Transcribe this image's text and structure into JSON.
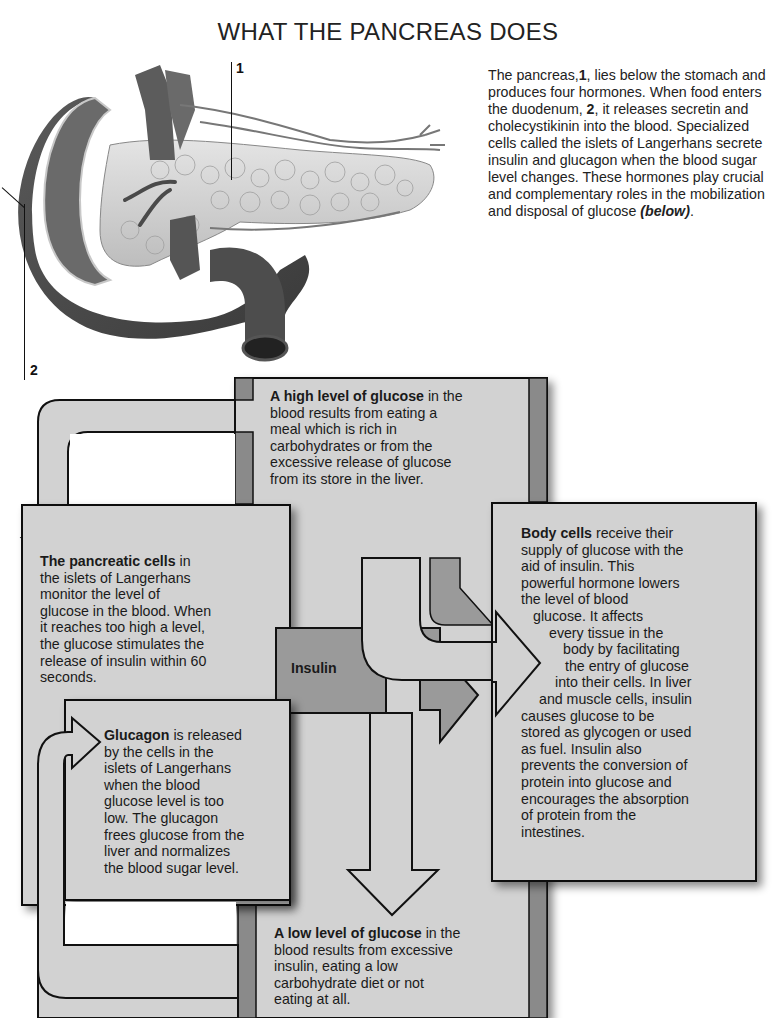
{
  "title": "WHAT THE PANCREAS DOES",
  "illustration": {
    "description": "Anatomical drawing of pancreas with duodenum and blood vessels",
    "labels": [
      {
        "number": "1",
        "target": "pancreas"
      },
      {
        "number": "2",
        "target": "duodenum"
      }
    ]
  },
  "intro": {
    "part1": "The pancreas,",
    "num1": "1",
    "part2": ", lies below the stomach and produces four hormones. When food enters the duodenum, ",
    "num2": "2",
    "part3": ", it releases secretin and cholecystikinin into the blood. Specialized cells called the islets of Langerhans secrete insulin and glucagon when the blood sugar level changes. These hormones play crucial and complementary roles in the mobilization and disposal of glucose ",
    "below": "(below)",
    "end": "."
  },
  "diagram": {
    "high_glucose": {
      "bold": "A high level of glucose",
      "lines": [
        " in the",
        "blood results from eating a",
        "meal which is rich in",
        "carbohydrates or from the",
        "excessive release of glucose",
        "from its store in the liver."
      ]
    },
    "pancreatic_cells": {
      "bold": "The pancreatic cells",
      "lines": [
        " in",
        "the islets of Langerhans",
        "monitor the level of",
        "glucose in the blood. When",
        "it reaches too high a level,",
        "the glucose stimulates the",
        "release of insulin within 60",
        "seconds."
      ]
    },
    "insulin_label": "Insulin",
    "body_cells": {
      "bold": "Body cells",
      "lines": [
        " receive their",
        "supply of glucose with the",
        "aid of insulin. This",
        "powerful hormone lowers",
        "the level of blood",
        "glucose. It affects",
        "every tissue in the",
        "body by facilitating",
        "the entry of glucose",
        "into their cells. In liver",
        "and muscle cells, insulin",
        "causes glucose to be",
        "stored as glycogen or used",
        "as fuel. Insulin also",
        "prevents the conversion of",
        "protein into glucose and",
        "encourages the absorption",
        "of protein from the",
        "intestines."
      ]
    },
    "glucagon": {
      "bold": "Glucagon",
      "lines": [
        " is released",
        "by the cells in the",
        "islets of Langerhans",
        "when the blood",
        "glucose level is too",
        "low. The glucagon",
        "frees glucose from the",
        "liver and normalizes",
        "the blood sugar level."
      ]
    },
    "low_glucose": {
      "bold": "A low level of glucose",
      "lines": [
        " in the",
        "blood results from excessive",
        "insulin, eating a low",
        "carbohydrate diet or not",
        "eating at all."
      ]
    }
  },
  "colors": {
    "box_fill": "#d2d2d2",
    "column_dark": "#8a8a8a",
    "insulin_block": "#9a9a9a",
    "outline": "#111111"
  }
}
